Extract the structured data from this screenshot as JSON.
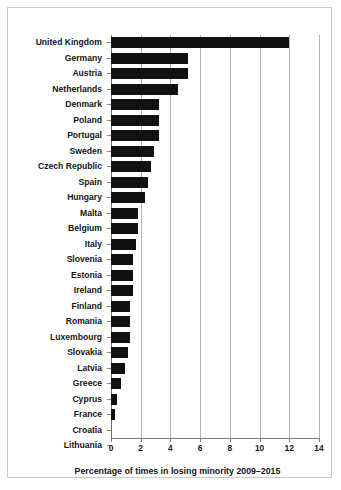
{
  "chart_data": {
    "type": "bar",
    "orientation": "horizontal",
    "title": "",
    "xlabel": "Percentage of times in losing minority 2009–2015",
    "ylabel": "",
    "xlim": [
      0,
      14
    ],
    "xticks": [
      0,
      2,
      4,
      6,
      8,
      10,
      12,
      14
    ],
    "xtick_labels": [
      "0",
      "2",
      "4",
      "6",
      "8",
      "10",
      "12",
      "14"
    ],
    "grid": true,
    "grid_axis": "x",
    "legend": false,
    "bar_color": "#111111",
    "categories": [
      "United Kingdom",
      "Germany",
      "Austria",
      "Netherlands",
      "Denmark",
      "Poland",
      "Portugal",
      "Sweden",
      "Czech Republic",
      "Spain",
      "Hungary",
      "Malta",
      "Belgium",
      "Italy",
      "Slovenia",
      "Estonia",
      "Ireland",
      "Finland",
      "Romania",
      "Luxembourg",
      "Slovakia",
      "Latvia",
      "Greece",
      "Cyprus",
      "France",
      "Croatia",
      "Lithuania"
    ],
    "values": [
      12.0,
      5.2,
      5.2,
      4.5,
      3.2,
      3.2,
      3.2,
      2.9,
      2.7,
      2.5,
      2.3,
      1.8,
      1.8,
      1.7,
      1.5,
      1.5,
      1.5,
      1.3,
      1.3,
      1.3,
      1.15,
      0.95,
      0.65,
      0.4,
      0.25,
      0.0,
      0.0
    ]
  }
}
